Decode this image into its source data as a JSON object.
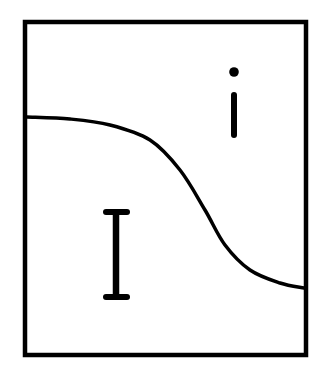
{
  "diagram": {
    "title": "",
    "frame": {
      "x": 25,
      "y": 22,
      "width": 281,
      "height": 333,
      "stroke_width": 4.5,
      "color": "#000000"
    },
    "boundary_curve": {
      "color": "#000000",
      "stroke_width": 3.5,
      "points": [
        [
          27,
          117
        ],
        [
          70,
          119
        ],
        [
          110,
          125
        ],
        [
          150,
          140
        ],
        [
          180,
          170
        ],
        [
          205,
          210
        ],
        [
          225,
          245
        ],
        [
          250,
          270
        ],
        [
          280,
          283
        ],
        [
          304,
          288
        ]
      ]
    },
    "regions": [
      {
        "id": "lower-left",
        "label": "I",
        "glyph": "capital-i",
        "position": {
          "x": 116,
          "y": 254
        }
      },
      {
        "id": "upper-right",
        "label": "i",
        "glyph": "lowercase-i",
        "position": {
          "x": 234,
          "y": 104
        }
      }
    ]
  }
}
